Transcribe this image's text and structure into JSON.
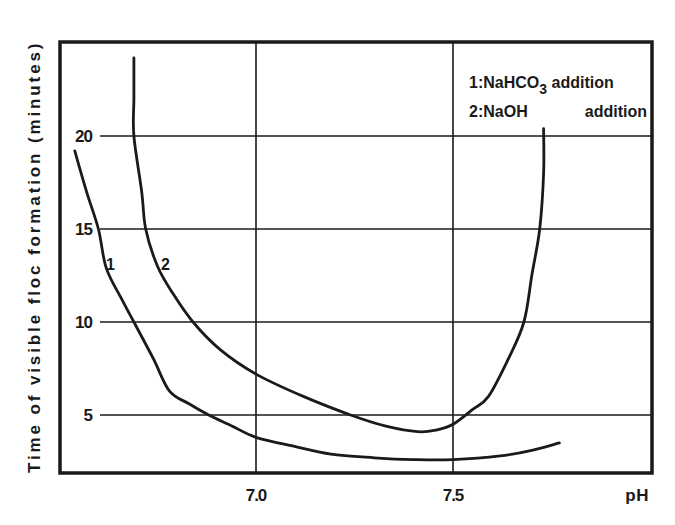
{
  "chart_data": {
    "type": "line",
    "title": "",
    "xlabel": "pH",
    "ylabel": "Time of visible floc formation (minutes)",
    "xlim": [
      6.51,
      8.0
    ],
    "ylim": [
      1.9,
      24.8
    ],
    "x_ticks": [
      "7.0",
      "7.5"
    ],
    "y_ticks": [
      "5",
      "10",
      "15",
      "20"
    ],
    "grid": true,
    "legend_position": "upper right (inside plot)",
    "legend": [
      {
        "id": "1",
        "prefix": "1:",
        "name": "NaHCO",
        "subscript": "3",
        "suffix": " addition"
      },
      {
        "id": "2",
        "prefix": "2:",
        "name": "NaOH",
        "subscript": "",
        "suffix": "    addition"
      }
    ],
    "series": [
      {
        "name": "1: NaHCO3 addition",
        "label": "1",
        "points": [
          [
            6.54,
            19.2
          ],
          [
            6.57,
            17.0
          ],
          [
            6.6,
            15.0
          ],
          [
            6.62,
            12.9
          ],
          [
            6.66,
            11.2
          ],
          [
            6.69,
            10.0
          ],
          [
            6.74,
            8.0
          ],
          [
            6.78,
            6.3
          ],
          [
            6.83,
            5.6
          ],
          [
            6.88,
            5.0
          ],
          [
            6.94,
            4.4
          ],
          [
            7.0,
            3.8
          ],
          [
            7.1,
            3.3
          ],
          [
            7.19,
            2.9
          ],
          [
            7.3,
            2.7
          ],
          [
            7.4,
            2.6
          ],
          [
            7.5,
            2.6
          ],
          [
            7.62,
            2.8
          ],
          [
            7.7,
            3.1
          ],
          [
            7.77,
            3.5
          ]
        ]
      },
      {
        "name": "2: NaOH addition",
        "label": "2",
        "points": [
          [
            6.69,
            24.2
          ],
          [
            6.69,
            22.0
          ],
          [
            6.69,
            20.0
          ],
          [
            6.71,
            17.0
          ],
          [
            6.72,
            15.0
          ],
          [
            6.75,
            13.0
          ],
          [
            6.79,
            11.5
          ],
          [
            6.84,
            10.0
          ],
          [
            6.91,
            8.5
          ],
          [
            7.0,
            7.2
          ],
          [
            7.12,
            6.0
          ],
          [
            7.24,
            5.0
          ],
          [
            7.33,
            4.4
          ],
          [
            7.41,
            4.1
          ],
          [
            7.46,
            4.2
          ],
          [
            7.5,
            4.5
          ],
          [
            7.55,
            5.3
          ],
          [
            7.59,
            6.0
          ],
          [
            7.64,
            8.0
          ],
          [
            7.68,
            10.0
          ],
          [
            7.7,
            12.5
          ],
          [
            7.72,
            15.0
          ],
          [
            7.73,
            18.0
          ],
          [
            7.73,
            20.4
          ]
        ]
      }
    ]
  },
  "colors": {
    "ink": "#1a1a1a",
    "background": "#ffffff"
  }
}
